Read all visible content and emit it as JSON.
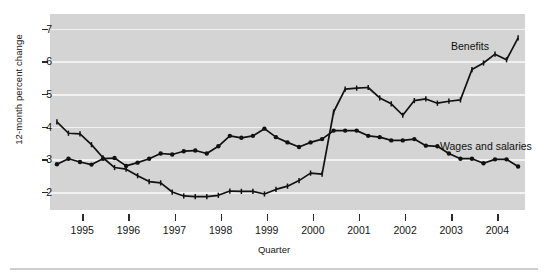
{
  "chart_data": {
    "type": "line",
    "title": "",
    "xlabel": "Quarter",
    "ylabel": "12-month percent change",
    "ylim": [
      1.45,
      7.45
    ],
    "yticks": [
      2,
      3,
      4,
      5,
      6,
      7
    ],
    "ytick_labels": [
      "2",
      "3",
      "4",
      "5",
      "6",
      "7"
    ],
    "xlim": [
      1994.3,
      2004.6
    ],
    "xticks": [
      1995,
      1996,
      1997,
      1998,
      1999,
      2000,
      2001,
      2002,
      2003,
      2004
    ],
    "xtick_labels": [
      "1995",
      "1996",
      "1997",
      "1998",
      "1999",
      "2000",
      "2001",
      "2002",
      "2003",
      "2004"
    ],
    "grid": "horizontal",
    "legend_position": "inline-annotations",
    "panel_background": "#d4d4d4",
    "gridline_color": "#f1f1f1",
    "series": [
      {
        "name": "Benefits",
        "marker": "tick",
        "color": "#111111",
        "x": [
          1994.45,
          1994.7,
          1994.95,
          1995.2,
          1995.45,
          1995.7,
          1995.95,
          1996.2,
          1996.45,
          1996.7,
          1996.95,
          1997.2,
          1997.45,
          1997.7,
          1997.95,
          1998.2,
          1998.45,
          1998.7,
          1998.95,
          1999.2,
          1999.45,
          1999.7,
          1999.95,
          2000.2,
          2000.45,
          2000.7,
          2000.95,
          2001.2,
          2001.45,
          2001.7,
          2001.95,
          2002.2,
          2002.45,
          2002.7,
          2002.95,
          2003.2,
          2003.45,
          2003.7,
          2003.95,
          2004.2,
          2004.45
        ],
        "values": [
          4.15,
          3.8,
          3.78,
          3.45,
          3.05,
          2.75,
          2.7,
          2.5,
          2.32,
          2.28,
          2.0,
          1.88,
          1.86,
          1.86,
          1.9,
          2.03,
          2.02,
          2.02,
          1.94,
          2.08,
          2.18,
          2.35,
          2.58,
          2.55,
          4.45,
          5.15,
          5.18,
          5.2,
          4.88,
          4.7,
          4.35,
          4.8,
          4.85,
          4.72,
          4.78,
          4.82,
          5.75,
          5.95,
          6.22,
          6.05,
          6.72
        ]
      },
      {
        "name": "Wages and salaries",
        "marker": "dot",
        "color": "#111111",
        "x": [
          1994.45,
          1994.7,
          1994.95,
          1995.2,
          1995.45,
          1995.7,
          1995.95,
          1996.2,
          1996.45,
          1996.7,
          1996.95,
          1997.2,
          1997.45,
          1997.7,
          1997.95,
          1998.2,
          1998.45,
          1998.7,
          1998.95,
          1999.2,
          1999.45,
          1999.7,
          1999.95,
          2000.2,
          2000.45,
          2000.7,
          2000.95,
          2001.2,
          2001.45,
          2001.7,
          2001.95,
          2002.2,
          2002.45,
          2002.7,
          2002.95,
          2003.2,
          2003.45,
          2003.7,
          2003.95,
          2004.2,
          2004.45
        ],
        "values": [
          2.85,
          3.02,
          2.92,
          2.84,
          3.02,
          3.04,
          2.8,
          2.9,
          3.02,
          3.18,
          3.15,
          3.25,
          3.27,
          3.18,
          3.4,
          3.72,
          3.66,
          3.72,
          3.94,
          3.68,
          3.52,
          3.38,
          3.52,
          3.62,
          3.88,
          3.88,
          3.88,
          3.72,
          3.68,
          3.58,
          3.58,
          3.62,
          3.42,
          3.4,
          3.18,
          3.02,
          3.02,
          2.88,
          3.0,
          3.0,
          2.78
        ]
      }
    ],
    "annotations": [
      {
        "text": "Benefits",
        "x": 2003.2,
        "y": 6.25
      },
      {
        "text": "Wages and salaries",
        "x": 2002.9,
        "y": 3.25
      }
    ]
  }
}
